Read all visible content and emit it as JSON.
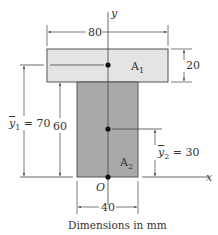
{
  "figure": {
    "caption": "Dimensions in mm",
    "colors": {
      "area1_fill": "#e4e4e4",
      "area2_fill": "#a9a9a9",
      "outline": "#555555",
      "line": "#444444"
    },
    "axes": {
      "x_label": "x",
      "y_label": "y",
      "origin_label": "O"
    },
    "areas": [
      {
        "name": "A",
        "sub": "1",
        "label": "A1",
        "width": 80,
        "height": 20
      },
      {
        "name": "A",
        "sub": "2",
        "label": "A2",
        "width": 40,
        "height": 60
      }
    ],
    "dimensions": {
      "top_width": "80",
      "top_height": "20",
      "web_height": "60",
      "web_width": "40",
      "ybar1": {
        "symbol": "y",
        "sub": "1",
        "value": "= 70"
      },
      "ybar2": {
        "symbol": "y",
        "sub": "2",
        "value": "= 30"
      }
    }
  }
}
